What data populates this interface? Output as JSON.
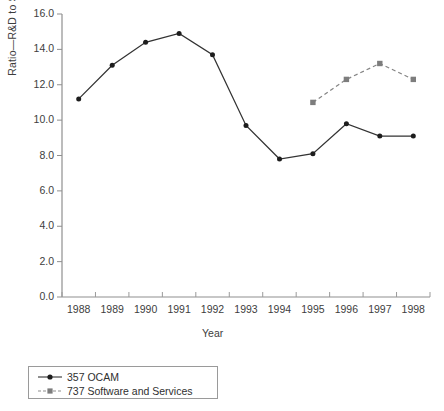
{
  "chart_data": {
    "type": "line",
    "title": "",
    "xlabel": "Year",
    "ylabel": "Ratio—R&D to Sales",
    "categories": [
      "1988",
      "1989",
      "1990",
      "1991",
      "1992",
      "1993",
      "1994",
      "1995",
      "1996",
      "1997",
      "1998"
    ],
    "ylim": [
      0.0,
      16.0
    ],
    "yticks": [
      "0.0",
      "2.0",
      "4.0",
      "6.0",
      "8.0",
      "10.0",
      "12.0",
      "14.0",
      "16.0"
    ],
    "ytick_values": [
      0.0,
      2.0,
      4.0,
      6.0,
      8.0,
      10.0,
      12.0,
      14.0,
      16.0
    ],
    "grid": false,
    "legend_position": "bottom-left",
    "series": [
      {
        "name": "357 OCAM",
        "marker": "circle",
        "line_style": "solid",
        "color": "#333333",
        "values": [
          11.2,
          13.1,
          14.4,
          14.9,
          13.7,
          9.7,
          7.8,
          8.1,
          9.8,
          9.1,
          9.1
        ]
      },
      {
        "name": "737 Software and Services",
        "marker": "square",
        "line_style": "dashed",
        "color": "#858585",
        "values": [
          null,
          null,
          null,
          null,
          null,
          null,
          null,
          11.0,
          12.3,
          13.2,
          12.3
        ]
      }
    ]
  },
  "axis": {
    "y_label": "Ratio—R&D to Sales",
    "x_label": "Year"
  },
  "legend": {
    "items": [
      {
        "label": "357 OCAM",
        "marker": "circle-marker",
        "color": "#333333",
        "dash": "solid"
      },
      {
        "label": "737 Software and Services",
        "marker": "square-marker",
        "color": "#858585",
        "dash": "dashed"
      }
    ]
  }
}
